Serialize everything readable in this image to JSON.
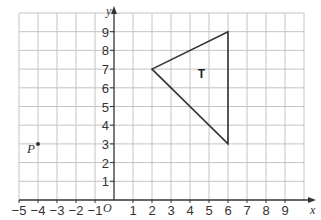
{
  "figure": {
    "axes": {
      "x_label": "x",
      "y_label": "y",
      "origin_label": "O",
      "x_range": [
        -5,
        10
      ],
      "y_range": [
        0,
        10
      ],
      "x_ticks": [
        -5,
        -4,
        -3,
        -2,
        -1,
        1,
        2,
        3,
        4,
        5,
        6,
        7,
        8,
        9
      ],
      "x_tick_labels": [
        "−5",
        "−4",
        "−3",
        "−2",
        "−1",
        "1",
        "2",
        "3",
        "4",
        "5",
        "6",
        "7",
        "8",
        "9"
      ],
      "y_ticks": [
        1,
        2,
        3,
        4,
        5,
        6,
        7,
        8,
        9
      ],
      "y_tick_labels": [
        "1",
        "2",
        "3",
        "4",
        "5",
        "6",
        "7",
        "8",
        "9"
      ]
    },
    "shapes": [
      {
        "label": "T",
        "type": "triangle",
        "vertices": [
          [
            2,
            7
          ],
          [
            6,
            9
          ],
          [
            6,
            3
          ]
        ],
        "label_pos": [
          4.6,
          6.5
        ]
      }
    ],
    "points": [
      {
        "label": "P",
        "x": -4,
        "y": 3
      }
    ],
    "colors": {
      "grid": "#c4c4c4",
      "axis": "#333333",
      "shape": "#333333"
    }
  }
}
